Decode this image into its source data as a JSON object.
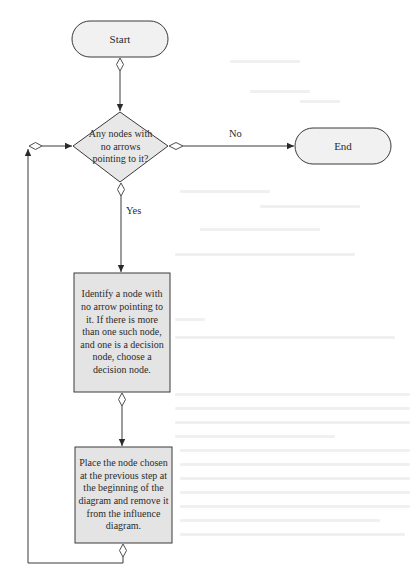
{
  "diagram": {
    "type": "flowchart",
    "colors": {
      "stroke": "#3a3a3a",
      "terminal_fill": "#f1f1f1",
      "decision_fill": "#e8e8e8",
      "process_fill": "#e4e4e4",
      "background": "#ffffff"
    },
    "nodes": {
      "start": {
        "shape": "terminal",
        "label": "Start"
      },
      "decision": {
        "shape": "decision",
        "label": "Any nodes with no arrows pointing to it?"
      },
      "end": {
        "shape": "terminal",
        "label": "End"
      },
      "identify": {
        "shape": "process",
        "label": "Identify a node with no arrow pointing to it. If there is more than one such node, and one is a decision node, choose a decision node."
      },
      "place": {
        "shape": "process",
        "label": "Place the node chosen at the previous step at the beginning of the diagram and remove it from the influence diagram."
      }
    },
    "edges": [
      {
        "from": "start",
        "to": "decision",
        "label": ""
      },
      {
        "from": "decision",
        "to": "end",
        "label": "No"
      },
      {
        "from": "decision",
        "to": "identify",
        "label": "Yes"
      },
      {
        "from": "identify",
        "to": "place",
        "label": ""
      },
      {
        "from": "place",
        "to": "decision",
        "label": ""
      }
    ]
  }
}
